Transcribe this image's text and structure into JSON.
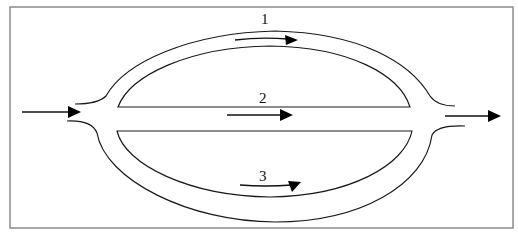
{
  "diagram": {
    "type": "parallel-flow-paths",
    "paths": [
      {
        "id": 1,
        "label": "1",
        "position": "top",
        "shape": "upper-arc",
        "flow_direction": "left-to-right"
      },
      {
        "id": 2,
        "label": "2",
        "position": "middle",
        "shape": "straight",
        "flow_direction": "left-to-right"
      },
      {
        "id": 3,
        "label": "3",
        "position": "bottom",
        "shape": "lower-arc",
        "flow_direction": "left-to-right"
      }
    ],
    "inlet": {
      "side": "left",
      "arrow": "arrow-right-icon"
    },
    "outlet": {
      "side": "right",
      "arrow": "arrow-right-icon"
    },
    "colors": {
      "line": "#1a1a1a",
      "frame": "#8a8a8a",
      "background": "#ffffff"
    }
  }
}
